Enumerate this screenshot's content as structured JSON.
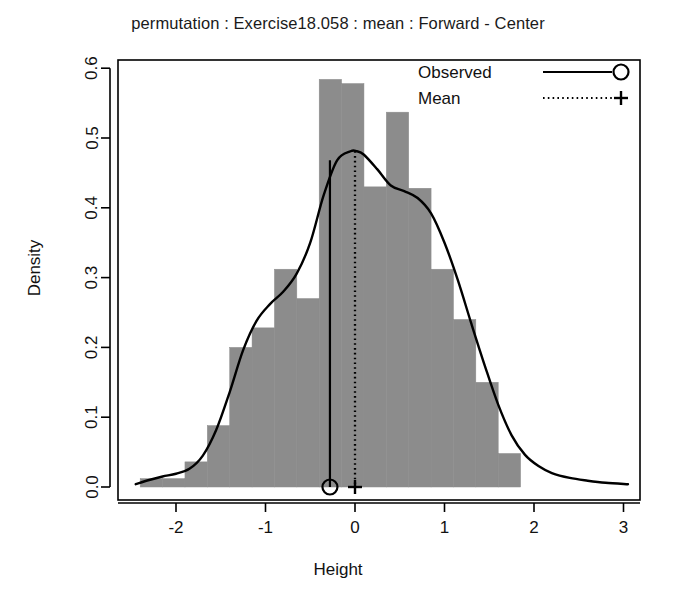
{
  "chart_data": {
    "type": "histogram",
    "title": "permutation : Exercise18.058 : mean : Forward - Center",
    "xlabel": "Height",
    "ylabel": "Density",
    "xlim": [
      -2.45,
      3.1
    ],
    "ylim": [
      0.0,
      0.625
    ],
    "grid": false,
    "xticks": [
      -2,
      -1,
      0,
      1,
      2,
      3
    ],
    "xtick_labels": [
      "-2",
      "-1",
      "0",
      "1",
      "2",
      "3"
    ],
    "yticks": [
      0.0,
      0.1,
      0.2,
      0.3,
      0.4,
      0.5,
      0.6
    ],
    "ytick_labels": [
      "0.0",
      "0.1",
      "0.2",
      "0.3",
      "0.4",
      "0.5",
      "0.6"
    ],
    "bar_color": "#8c8c8c",
    "line_color": "#000000",
    "bin_width": 0.25,
    "bin_edges": [
      -2.4,
      -2.15,
      -1.9,
      -1.65,
      -1.4,
      -1.15,
      -0.9,
      -0.65,
      -0.4,
      -0.15,
      0.1,
      0.35,
      0.6,
      0.85,
      1.1,
      1.35,
      1.6,
      1.85
    ],
    "bin_centers": [
      -2.275,
      -2.025,
      -1.775,
      -1.525,
      -1.275,
      -1.025,
      -0.775,
      -0.525,
      -0.275,
      -0.025,
      0.225,
      0.475,
      0.725,
      0.975,
      1.225,
      1.475,
      1.725
    ],
    "densities": [
      0.012,
      0.012,
      0.036,
      0.088,
      0.2,
      0.228,
      0.312,
      0.27,
      0.584,
      0.578,
      0.43,
      0.537,
      0.428,
      0.312,
      0.24,
      0.15,
      0.048
    ],
    "density_curve": {
      "name": "kernel density",
      "x": [
        -2.45,
        -2.3,
        -2.15,
        -2.0,
        -1.85,
        -1.7,
        -1.55,
        -1.4,
        -1.25,
        -1.1,
        -0.95,
        -0.8,
        -0.65,
        -0.5,
        -0.35,
        -0.2,
        -0.05,
        0.02,
        0.1,
        0.25,
        0.4,
        0.55,
        0.7,
        0.85,
        1.0,
        1.15,
        1.3,
        1.45,
        1.6,
        1.75,
        1.9,
        2.05,
        2.2,
        2.4,
        2.6,
        2.8,
        3.05
      ],
      "y": [
        0.004,
        0.01,
        0.015,
        0.019,
        0.026,
        0.045,
        0.082,
        0.136,
        0.196,
        0.238,
        0.262,
        0.28,
        0.306,
        0.35,
        0.418,
        0.468,
        0.481,
        0.481,
        0.476,
        0.455,
        0.432,
        0.424,
        0.414,
        0.392,
        0.35,
        0.296,
        0.234,
        0.174,
        0.118,
        0.074,
        0.046,
        0.03,
        0.02,
        0.013,
        0.009,
        0.006,
        0.004
      ]
    },
    "markers": [
      {
        "name": "Observed",
        "x": -0.28,
        "y": 0.0,
        "symbol": "circle",
        "line": "solid",
        "line_top": 0.468
      },
      {
        "name": "Mean",
        "x": 0.0,
        "y": 0.0,
        "symbol": "plus",
        "line": "dotted",
        "line_top": 0.481
      }
    ],
    "legend": {
      "position": "top-right",
      "entries": [
        {
          "label": "Observed",
          "symbol": "circle",
          "line_style": "solid"
        },
        {
          "label": "Mean",
          "symbol": "plus",
          "line_style": "dotted"
        }
      ]
    }
  }
}
